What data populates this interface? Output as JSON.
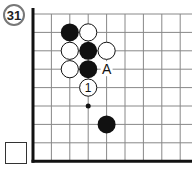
{
  "problem": {
    "number": "31",
    "label_A": "A",
    "move_number": "1"
  },
  "board": {
    "grid_color": "#888888",
    "edge_color": "#111111",
    "black_stones": [
      [
        2,
        1
      ],
      [
        3,
        2
      ],
      [
        3,
        3
      ],
      [
        4,
        6
      ]
    ],
    "white_stones": [
      [
        3,
        1
      ],
      [
        2,
        2
      ],
      [
        4,
        2
      ],
      [
        2,
        3
      ]
    ],
    "numbered_white": {
      "col": 3,
      "row": 4,
      "label": "1"
    },
    "marker_A": {
      "col": 4,
      "row": 3
    },
    "small_dot": {
      "col": 3,
      "row": 5
    }
  }
}
